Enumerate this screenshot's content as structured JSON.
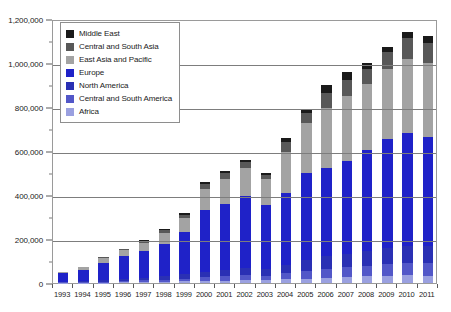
{
  "chart_data": {
    "type": "bar",
    "subtype": "stacked-column",
    "title": "",
    "xlabel": "",
    "ylabel": "",
    "ylim": [
      0,
      1200000
    ],
    "ytick_step": 200000,
    "ytick_labels": [
      "0",
      "200,000",
      "400,000",
      "600,000",
      "800,000",
      "1,000,000",
      "1,200,000"
    ],
    "ytick_values": [
      0,
      200000,
      400000,
      600000,
      800000,
      1000000,
      1200000
    ],
    "grid": true,
    "grid_axis": "y",
    "legend_position": "top-left",
    "categories": [
      "1993",
      "1994",
      "1995",
      "1996",
      "1997",
      "1998",
      "1999",
      "2000",
      "2001",
      "2002",
      "2003",
      "2004",
      "2005",
      "2006",
      "2007",
      "2008",
      "2009",
      "2010",
      "2011"
    ],
    "series": [
      {
        "name": "Africa",
        "color": "#9aa0e0",
        "values": [
          1000,
          1500,
          2000,
          3000,
          4000,
          5000,
          7000,
          9000,
          11000,
          13000,
          12000,
          16000,
          20000,
          24000,
          27000,
          30000,
          33000,
          35000,
          34000
        ]
      },
      {
        "name": "Central and South America",
        "color": "#5257c8",
        "values": [
          2000,
          3000,
          4000,
          6000,
          8000,
          10000,
          13000,
          17000,
          20000,
          23000,
          21000,
          28000,
          34000,
          40000,
          44000,
          48000,
          53000,
          56000,
          55000
        ]
      },
      {
        "name": "North America",
        "color": "#2a30b4",
        "values": [
          3000,
          4500,
          6000,
          9000,
          12000,
          15000,
          20000,
          25000,
          29000,
          33000,
          30000,
          40000,
          49000,
          57000,
          62000,
          68000,
          75000,
          79000,
          78000
        ]
      },
      {
        "name": "Europe",
        "color": "#1f22c8",
        "values": [
          38000,
          50000,
          81000,
          105000,
          122000,
          148000,
          190000,
          280000,
          300000,
          325000,
          290000,
          325000,
          395000,
          400000,
          420000,
          460000,
          492000,
          514000,
          495000
        ]
      },
      {
        "name": "East Asia and Pacific",
        "color": "#a3a3a3",
        "values": [
          5000,
          13000,
          20000,
          25000,
          35000,
          50000,
          65000,
          95000,
          115000,
          130000,
          120000,
          185000,
          230000,
          275000,
          295000,
          300000,
          320000,
          336000,
          340000
        ]
      },
      {
        "name": "Central and South Asia",
        "color": "#585858",
        "values": [
          1000,
          2000,
          4000,
          5000,
          8000,
          11000,
          15000,
          22000,
          23000,
          25000,
          18000,
          45000,
          45000,
          70000,
          75000,
          65000,
          75000,
          92000,
          90000
        ]
      },
      {
        "name": "Middle East",
        "color": "#1a1a1a",
        "values": [
          0,
          1000,
          3000,
          2000,
          6000,
          6000,
          10000,
          12000,
          12000,
          11000,
          9000,
          21000,
          17000,
          34000,
          37000,
          29000,
          27000,
          28000,
          33000
        ]
      }
    ],
    "totals": [
      50000,
      75000,
      120000,
      155000,
      195000,
      245000,
      320000,
      460000,
      510000,
      560000,
      500000,
      660000,
      790000,
      900000,
      960000,
      1000000,
      1075000,
      1140000,
      1125000
    ]
  },
  "legend": {
    "items": [
      {
        "label": "Middle East",
        "color": "#1a1a1a"
      },
      {
        "label": "Central and South Asia",
        "color": "#585858"
      },
      {
        "label": "East Asia and Pacific",
        "color": "#a3a3a3"
      },
      {
        "label": "Europe",
        "color": "#1f22c8"
      },
      {
        "label": "North America",
        "color": "#2a30b4"
      },
      {
        "label": "Central and South America",
        "color": "#5257c8"
      },
      {
        "label": "Africa",
        "color": "#9aa0e0"
      }
    ]
  }
}
